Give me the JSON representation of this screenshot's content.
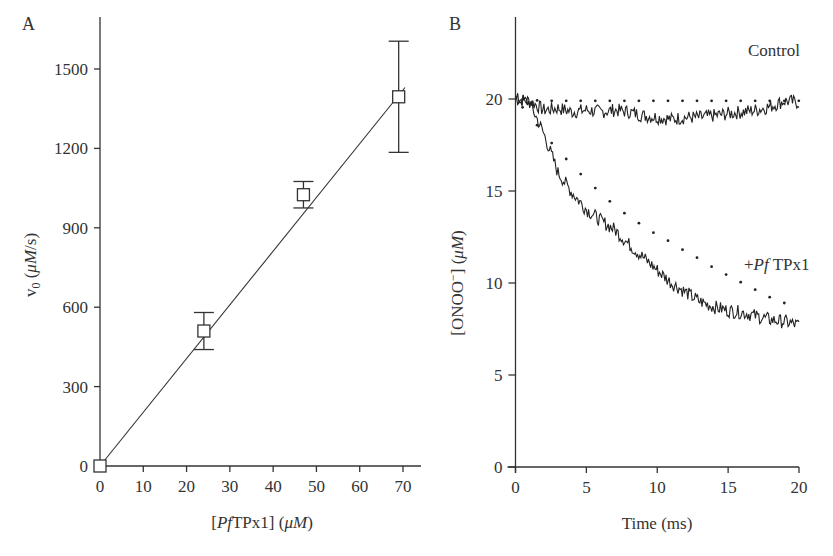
{
  "chart_data": [
    {
      "panel": "A",
      "type": "scatter",
      "title": "",
      "xlabel": "[PfTPx1] (μM)",
      "ylabel": "v0 (μM/s)",
      "xlim": [
        0,
        74
      ],
      "ylim": [
        0,
        1700
      ],
      "xticks": [
        0,
        10,
        20,
        30,
        40,
        50,
        60,
        70
      ],
      "yticks": [
        0,
        300,
        600,
        900,
        1200,
        1500
      ],
      "grid": false,
      "legend": null,
      "series": [
        {
          "name": "v0 measurements",
          "marker": "open-square",
          "x": [
            0,
            24,
            47,
            69
          ],
          "y": [
            0,
            510,
            1025,
            1395
          ],
          "error": [
            0,
            70,
            50,
            210
          ]
        },
        {
          "name": "linear fit",
          "style": "line",
          "x": [
            0,
            70
          ],
          "y": [
            0,
            1430
          ]
        }
      ]
    },
    {
      "panel": "B",
      "type": "line",
      "title": "",
      "xlabel": "Time (ms)",
      "ylabel": "[ONOO⁻] (μM)",
      "xlim": [
        0,
        20
      ],
      "ylim": [
        0,
        24
      ],
      "xticks": [
        0,
        5,
        10,
        15,
        20
      ],
      "yticks": [
        0,
        5,
        10,
        15,
        20
      ],
      "grid": false,
      "annotations": [
        "Control",
        "+Pf TPx1"
      ],
      "series": [
        {
          "name": "Control (trace)",
          "style": "solid-noisy",
          "x": [
            0,
            1,
            2,
            3,
            4,
            5,
            6,
            7,
            8,
            9,
            10,
            11,
            12,
            13,
            14,
            15,
            16,
            17,
            18,
            19,
            20
          ],
          "y": [
            20.0,
            19.9,
            19.4,
            19.5,
            19.3,
            19.4,
            19.3,
            19.4,
            19.3,
            19.1,
            19.0,
            18.9,
            19.0,
            19.0,
            19.1,
            19.2,
            19.3,
            19.4,
            19.6,
            19.9,
            19.8
          ]
        },
        {
          "name": "Control (simulation)",
          "style": "dotted",
          "x": [
            0,
            2,
            4,
            6,
            8,
            10,
            12,
            14,
            16,
            18,
            20
          ],
          "y": [
            20.0,
            19.9,
            19.9,
            19.9,
            19.9,
            19.9,
            19.9,
            19.9,
            19.9,
            19.9,
            19.9
          ]
        },
        {
          "name": "+Pf TPx1 (trace)",
          "style": "solid-noisy",
          "x": [
            0,
            1,
            2,
            3,
            4,
            5,
            6,
            7,
            8,
            9,
            10,
            11,
            12,
            13,
            14,
            15,
            16,
            17,
            18,
            19,
            20
          ],
          "y": [
            20.0,
            19.8,
            18.1,
            16.0,
            14.9,
            14.0,
            13.4,
            12.9,
            12.1,
            11.4,
            10.7,
            10.0,
            9.5,
            9.0,
            8.7,
            8.5,
            8.4,
            8.2,
            8.0,
            7.9,
            7.7
          ]
        },
        {
          "name": "+Pf TPx1 (simulation)",
          "style": "dotted",
          "x": [
            0,
            1,
            2,
            3,
            4,
            5,
            6,
            7,
            8,
            9,
            10,
            11,
            12,
            13,
            14,
            15,
            16,
            17,
            18,
            19
          ],
          "y": [
            20.0,
            19.1,
            18.1,
            17.2,
            16.4,
            15.6,
            14.9,
            14.2,
            13.6,
            13.1,
            12.6,
            12.2,
            11.7,
            11.3,
            10.8,
            10.4,
            10.0,
            9.6,
            9.2,
            8.9
          ]
        }
      ]
    }
  ],
  "panels": {
    "a": {
      "letter": "A",
      "xlabel_pre": "[",
      "xlabel_italic": "Pf",
      "xlabel_mid": "TPx1] (",
      "xlabel_unit_mu": "μ",
      "xlabel_unit_italic": "M",
      "xlabel_post": ")",
      "ylabel_v": "v",
      "ylabel_sub": "0",
      "ylabel_open": " (",
      "ylabel_unit_italic": "μM",
      "ylabel_close": "/s)"
    },
    "b": {
      "letter": "B",
      "xlabel": "Time (ms)",
      "ylabel_pre": "[ONOO",
      "ylabel_sup": "−",
      "ylabel_mid": "] (",
      "ylabel_unit_italic": "μM",
      "ylabel_post": ")",
      "label_control": "Control",
      "label_tpx_plus": "+",
      "label_tpx_italic": "Pf",
      "label_tpx_rest": " TPx1"
    }
  }
}
